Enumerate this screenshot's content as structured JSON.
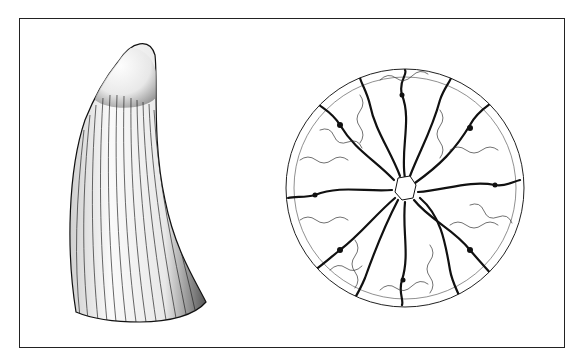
{
  "figure": {
    "frame": {
      "x": 19,
      "y": 18,
      "width": 546,
      "height": 330,
      "color": "#222222"
    },
    "specimens": [
      {
        "name": "conical fossil tooth, lateral view",
        "shape": "curved cone with longitudinal ridges",
        "bbox": [
          65,
          42,
          205,
          322
        ]
      },
      {
        "name": "tooth cross-section",
        "shape": "circular section with radially folded (labyrinthine) dentine",
        "center": [
          405,
          188
        ],
        "radius": 120
      }
    ],
    "colors": {
      "ink": "#111111",
      "paper": "#ffffff"
    }
  }
}
